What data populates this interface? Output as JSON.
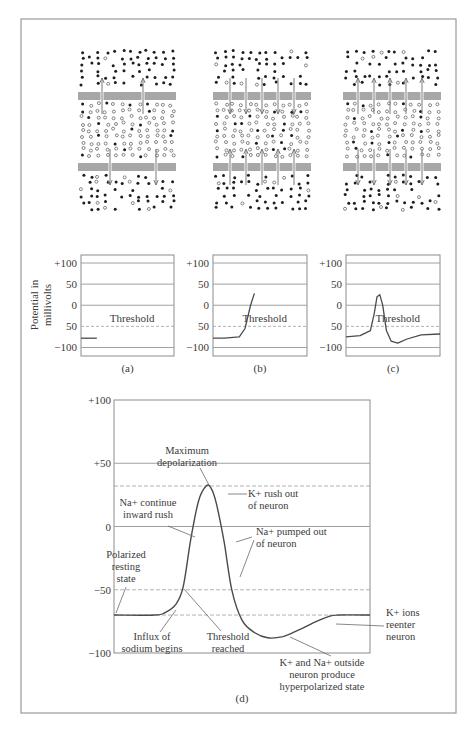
{
  "figure": {
    "frame": {
      "x": 21,
      "y": 19,
      "w": 435,
      "h": 694,
      "stroke": "#9a9a9a"
    },
    "colors": {
      "membrane": "#a7a7a7",
      "ion_filled": "#1e1e1e",
      "ion_open": "#555555",
      "arrow": "#7a7a7a",
      "line": "#4a4a4a",
      "grid": "#a0a0a0"
    }
  },
  "membrane_panels": [
    {
      "id": "a",
      "x": 78,
      "y": 50,
      "w": 98,
      "h": 160,
      "arrow_direction": "outward",
      "top_arrows": [
        102,
        143
      ],
      "bottom_arrows": [
        110,
        156
      ],
      "seed": 11
    },
    {
      "id": "b",
      "x": 213,
      "y": 50,
      "w": 98,
      "h": 160,
      "arrow_direction": "inward",
      "top_arrows": [
        230,
        246,
        262,
        278,
        294
      ],
      "bottom_arrows": [
        230,
        246,
        262,
        278,
        294
      ],
      "seed": 23
    },
    {
      "id": "c",
      "x": 343,
      "y": 50,
      "w": 98,
      "h": 160,
      "arrow_direction": "outward",
      "top_arrows": [
        358,
        374,
        390,
        406,
        422
      ],
      "bottom_arrows": [
        358,
        374,
        390,
        406,
        422
      ],
      "seed": 37
    }
  ],
  "y_axis_label": [
    "Potential in",
    "millivolts"
  ],
  "chart_data": [
    {
      "type": "line",
      "id": "a",
      "caption": "(a)",
      "box": {
        "x": 81,
        "y": 255,
        "w": 93,
        "h": 101
      },
      "yticks": [
        "+100",
        "50",
        "0",
        "50",
        "−100"
      ],
      "ytick_values": [
        100,
        50,
        0,
        -50,
        -100
      ],
      "ylim": [
        -120,
        100
      ],
      "threshold_label": "Threshold",
      "threshold": -50,
      "x": [
        0,
        0.17
      ],
      "y": [
        -78,
        -78
      ]
    },
    {
      "type": "line",
      "id": "b",
      "caption": "(b)",
      "box": {
        "x": 213,
        "y": 255,
        "w": 94,
        "h": 101
      },
      "yticks": [
        "+100",
        "50",
        "0",
        "50",
        "−100"
      ],
      "ytick_values": [
        100,
        50,
        0,
        -50,
        -100
      ],
      "ylim": [
        -120,
        100
      ],
      "threshold_label": "Threshold",
      "threshold": -50,
      "x": [
        0,
        0.12,
        0.28,
        0.34,
        0.4,
        0.44
      ],
      "y": [
        -78,
        -78,
        -75,
        -55,
        0,
        28
      ]
    },
    {
      "type": "line",
      "id": "c",
      "caption": "(c)",
      "box": {
        "x": 346,
        "y": 255,
        "w": 94,
        "h": 101
      },
      "yticks": [
        "+100",
        "50",
        "0",
        "50",
        "−100"
      ],
      "ytick_values": [
        100,
        50,
        0,
        -50,
        -100
      ],
      "ylim": [
        -120,
        100
      ],
      "threshold_label": "Threshold",
      "threshold": -50,
      "x": [
        0,
        0.15,
        0.26,
        0.3,
        0.33,
        0.36,
        0.39,
        0.43,
        0.48,
        0.55,
        0.65,
        0.8,
        1.0
      ],
      "y": [
        -75,
        -72,
        -60,
        -20,
        20,
        25,
        0,
        -60,
        -85,
        -90,
        -80,
        -70,
        -68
      ]
    },
    {
      "type": "line",
      "id": "d",
      "caption": "(d)",
      "box": {
        "x": 114,
        "y": 400,
        "w": 256,
        "h": 253
      },
      "yticks": [
        "+100",
        "+50",
        "0",
        "−50",
        "−100"
      ],
      "ytick_values": [
        100,
        50,
        0,
        -50,
        -100
      ],
      "ylim": [
        -100,
        100
      ],
      "solid_gridlines": [
        50,
        0
      ],
      "dashed_lines": [
        32,
        -50,
        -70
      ],
      "x": [
        0,
        0.16,
        0.2,
        0.24,
        0.27,
        0.3,
        0.33,
        0.36,
        0.38,
        0.4,
        0.43,
        0.46,
        0.5,
        0.55,
        0.6,
        0.66,
        0.72,
        0.78,
        0.84,
        0.88,
        1.0
      ],
      "y": [
        -70,
        -70,
        -68,
        -62,
        -48,
        -10,
        20,
        32,
        30,
        18,
        -12,
        -50,
        -74,
        -84,
        -88,
        -87,
        -82,
        -76,
        -71,
        -70,
        -70
      ],
      "annotations": [
        {
          "lines": [
            "Maximum",
            "depolarization"
          ],
          "x": 187,
          "y": 454,
          "anchor": "middle",
          "pointer": [
            [
              200,
              468
            ],
            [
              209,
              485
            ]
          ]
        },
        {
          "lines": [
            "K+ rush out",
            "of neuron"
          ],
          "x": 248,
          "y": 497,
          "anchor": "start",
          "pointer": [
            [
              247,
              494
            ],
            [
              228,
              494
            ]
          ]
        },
        {
          "lines": [
            "Na+ continue",
            "inward rush"
          ],
          "x": 148,
          "y": 506,
          "anchor": "middle",
          "pointer": [
            [
              168,
              526
            ],
            [
              195,
              537
            ]
          ]
        },
        {
          "lines": [
            "Na+ pumped out",
            "of neuron"
          ],
          "x": 256,
          "y": 535,
          "anchor": "start",
          "pointer": [
            [
              252,
              537
            ],
            [
              236,
              542
            ]
          ],
          "pointer2": [
            [
              254,
              540
            ],
            [
              240,
              577
            ]
          ]
        },
        {
          "lines": [
            "Polarized",
            "resting",
            "state"
          ],
          "x": 126,
          "y": 558,
          "anchor": "middle",
          "pointer": [
            [
              126,
              587
            ],
            [
              116,
              613
            ]
          ]
        },
        {
          "lines": [
            "Influx of",
            "sodium begins"
          ],
          "x": 152,
          "y": 640,
          "anchor": "middle",
          "pointer": [
            [
              160,
              632
            ],
            [
              176,
              610
            ]
          ]
        },
        {
          "lines": [
            "Threshold",
            "reached"
          ],
          "x": 228,
          "y": 640,
          "anchor": "middle",
          "pointer": [
            [
              221,
              631
            ],
            [
              184,
              589
            ]
          ]
        },
        {
          "lines": [
            "K+ ions",
            "reenter",
            "neuron"
          ],
          "x": 386,
          "y": 616,
          "anchor": "start",
          "pointer": [
            [
              384,
              626
            ],
            [
              336,
              624
            ]
          ]
        },
        {
          "lines": [
            "K+ and Na+ outside",
            "neuron produce",
            "hyperpolarized state"
          ],
          "x": 322,
          "y": 666,
          "anchor": "middle",
          "pointer": [
            [
              331,
              656
            ],
            [
              290,
              637
            ]
          ]
        }
      ]
    }
  ]
}
